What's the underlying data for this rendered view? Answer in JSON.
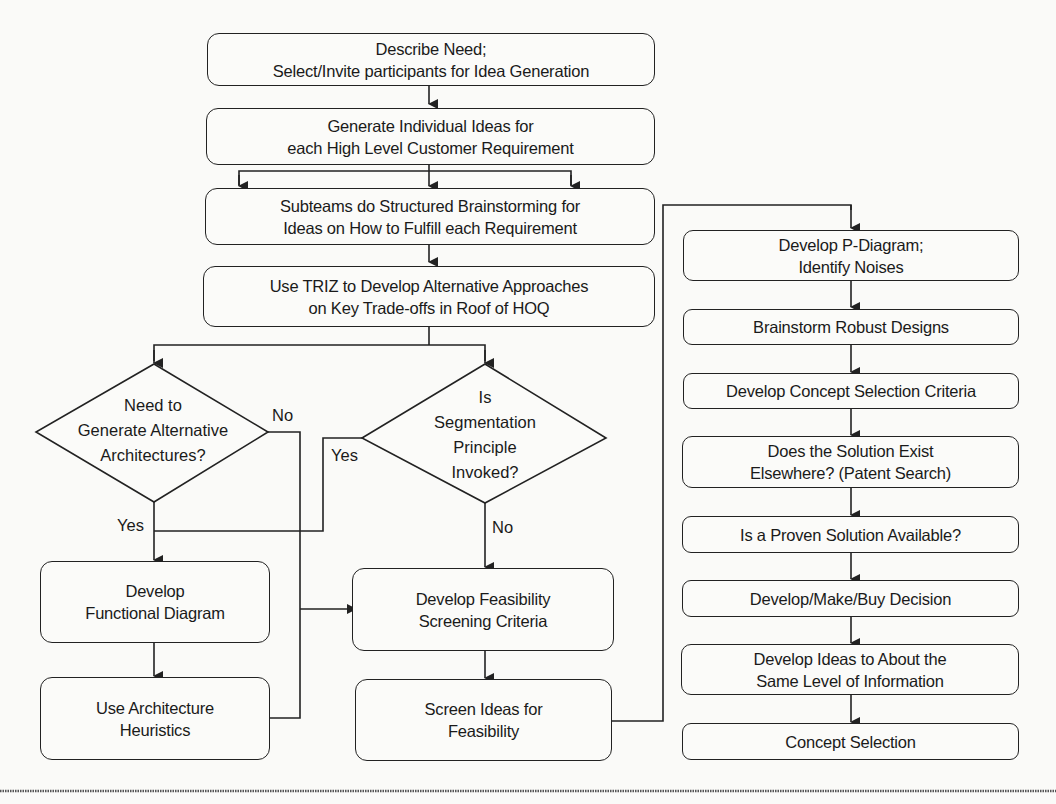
{
  "diagram": {
    "type": "flowchart",
    "boxes": {
      "describe_need": "Describe Need;\nSelect/Invite participants for Idea Generation",
      "generate_ideas": "Generate Individual Ideas for\neach High Level Customer Requirement",
      "subteams": "Subteams do Structured Brainstorming for\nIdeas on How to Fulfill each Requirement",
      "triz": "Use TRIZ to Develop Alternative Approaches\non Key Trade-offs in Roof of HOQ",
      "functional_diagram": "Develop\nFunctional Diagram",
      "architecture_heuristics": "Use Architecture\nHeuristics",
      "feasibility_criteria": "Develop Feasibility\nScreening Criteria",
      "screen_ideas": "Screen Ideas for\nFeasibility",
      "p_diagram": "Develop P-Diagram;\nIdentify Noises",
      "robust_designs": "Brainstorm Robust Designs",
      "concept_criteria": "Develop Concept Selection Criteria",
      "solution_exist": "Does the Solution Exist\nElsewhere? (Patent Search)",
      "proven_solution": "Is a Proven Solution Available?",
      "make_buy": "Develop/Make/Buy Decision",
      "same_level": "Develop Ideas to About the\nSame Level of Information",
      "concept_selection": "Concept Selection"
    },
    "decisions": {
      "alt_architectures": "Need to\nGenerate Alternative\nArchitectures?",
      "segmentation": "Is\nSegmentation\nPrinciple\nInvoked?"
    },
    "labels": {
      "alt_no": "No",
      "alt_yes": "Yes",
      "seg_yes": "Yes",
      "seg_no": "No"
    },
    "colors": {
      "line": "#222222",
      "background": "#fafaf8"
    }
  }
}
